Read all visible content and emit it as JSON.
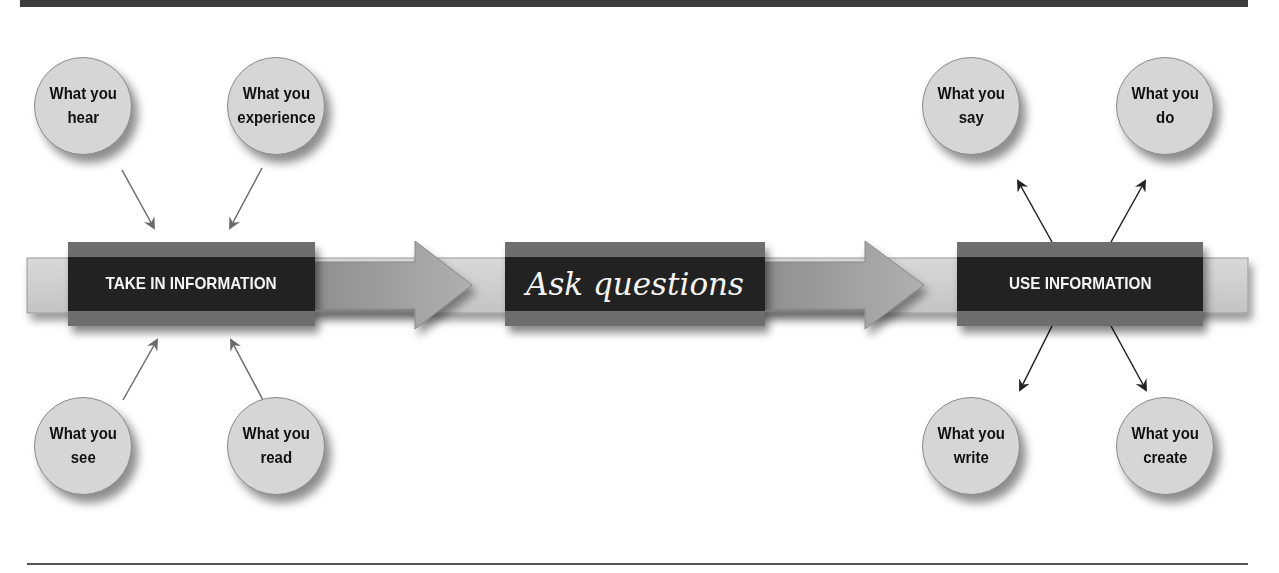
{
  "diagram": {
    "stages": [
      {
        "id": "take-in",
        "label": "TAKE IN INFORMATION"
      },
      {
        "id": "ask",
        "label": "Ask questions"
      },
      {
        "id": "use",
        "label": "USE INFORMATION"
      }
    ],
    "inputs": [
      {
        "line1": "What you",
        "line2": "hear"
      },
      {
        "line1": "What you",
        "line2": "experience"
      },
      {
        "line1": "What you",
        "line2": "see"
      },
      {
        "line1": "What you",
        "line2": "read"
      }
    ],
    "outputs": [
      {
        "line1": "What you",
        "line2": "say"
      },
      {
        "line1": "What you",
        "line2": "do"
      },
      {
        "line1": "What you",
        "line2": "write"
      },
      {
        "line1": "What you",
        "line2": "create"
      }
    ],
    "colors": {
      "box_dark": "#222222",
      "box_stripe": "#6e6e6e",
      "circle_fill": "#d6d6d6",
      "bar_fill": "#cfcfcf",
      "arrowhead_fill": "#9a9a9a",
      "connector_input": "#6a6a6a",
      "connector_output": "#222222"
    }
  }
}
